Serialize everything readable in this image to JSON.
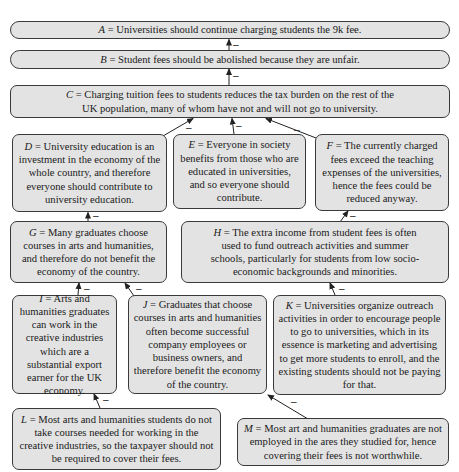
{
  "diagram": {
    "type": "argument-attack-graph",
    "nodes": [
      {
        "id": "A",
        "label": "A",
        "text": " = Universities should continue charging students the 9k fee."
      },
      {
        "id": "B",
        "label": "B",
        "text": " = Student fees should be abolished because they are unfair."
      },
      {
        "id": "C",
        "label": "C",
        "text": " = Charging tuition fees to students reduces the tax burden on the rest of the UK population, many of whom have not and will not go to university."
      },
      {
        "id": "D",
        "label": "D",
        "text": " = University education is an investment in the economy of the whole country, and therefore everyone should contribute to university education."
      },
      {
        "id": "E",
        "label": "E",
        "text": " = Everyone in society benefits from those who are educated in universities, and so everyone should contribute."
      },
      {
        "id": "F",
        "label": "F",
        "text": " = The currently charged fees exceed the teaching expenses of the universities, hence the fees could be reduced anyway."
      },
      {
        "id": "G",
        "label": "G",
        "text": " = Many graduates choose courses in arts and humanities, and therefore do not benefit the economy of the country."
      },
      {
        "id": "H",
        "label": "H",
        "text": " = The extra income from student fees is often used to fund outreach activities and summer schools, particularly for students from low socio-economic backgrounds and minorities."
      },
      {
        "id": "I",
        "label": "I",
        "text": " = Arts and humanities graduates can work in the creative industries which are a substantial export earner for the UK economy."
      },
      {
        "id": "J",
        "label": "J",
        "text": " = Graduates that choose courses in arts and humanities often become successful company employees or business owners, and therefore benefit the economy of the country."
      },
      {
        "id": "K",
        "label": "K",
        "text": " = Universities organize outreach activities in order to encourage people to go to universities, which in its essence is marketing and advertising to get more students to enroll, and the existing students should not be paying for that."
      },
      {
        "id": "L",
        "label": "L",
        "text": " = Most arts and humanities students do not take courses needed for working in the creative industries, so the taxpayer should not be required to cover their fees."
      },
      {
        "id": "M",
        "label": "M",
        "text": " = Most art and humanities graduates are not employed in the ares they studied for, hence covering their fees is not worthwhile."
      }
    ],
    "edges": [
      {
        "from": "B",
        "to": "A",
        "sign": "–"
      },
      {
        "from": "C",
        "to": "B",
        "sign": "–"
      },
      {
        "from": "D",
        "to": "C",
        "sign": "–"
      },
      {
        "from": "E",
        "to": "C",
        "sign": "–"
      },
      {
        "from": "F",
        "to": "C",
        "sign": "–"
      },
      {
        "from": "G",
        "to": "D",
        "sign": "–"
      },
      {
        "from": "H",
        "to": "F",
        "sign": "–"
      },
      {
        "from": "I",
        "to": "G",
        "sign": "–"
      },
      {
        "from": "J",
        "to": "G",
        "sign": "–"
      },
      {
        "from": "K",
        "to": "H",
        "sign": "–"
      },
      {
        "from": "L",
        "to": "I",
        "sign": "–"
      },
      {
        "from": "M",
        "to": "J",
        "sign": "–"
      }
    ]
  },
  "colors": {
    "node_fill": "#e3e3e3",
    "node_border": "#3a3a3a",
    "edge": "#222222"
  }
}
